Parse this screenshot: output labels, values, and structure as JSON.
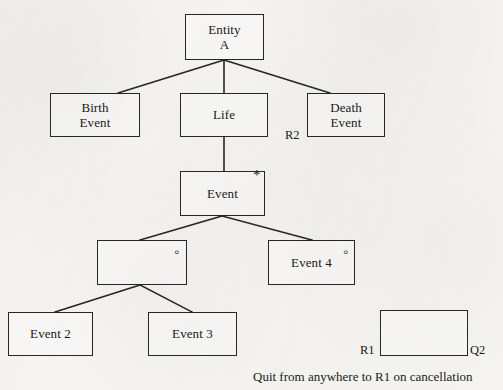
{
  "diagram": {
    "type": "statechart",
    "background_color": "#f6f5f2",
    "line_color": "#262626",
    "nodes": [
      {
        "id": "entity_a",
        "label": "Entity\nA",
        "x": 185,
        "y": 14,
        "w": 79,
        "h": 46,
        "marker": ""
      },
      {
        "id": "birth_event",
        "label": "Birth\nEvent",
        "x": 50,
        "y": 93,
        "w": 90,
        "h": 44,
        "marker": ""
      },
      {
        "id": "life",
        "label": "Life",
        "x": 180,
        "y": 93,
        "w": 88,
        "h": 44,
        "marker": ""
      },
      {
        "id": "death_event",
        "label": "Death\nEvent",
        "x": 307,
        "y": 93,
        "w": 78,
        "h": 44,
        "marker": ""
      },
      {
        "id": "event",
        "label": "Event",
        "x": 180,
        "y": 171,
        "w": 85,
        "h": 45,
        "marker": "asterisk"
      },
      {
        "id": "blank_left",
        "label": "",
        "x": 97,
        "y": 240,
        "w": 90,
        "h": 45,
        "marker": "circle"
      },
      {
        "id": "event4",
        "label": "Event 4",
        "x": 268,
        "y": 240,
        "w": 87,
        "h": 45,
        "marker": "circle"
      },
      {
        "id": "event2",
        "label": "Event 2",
        "x": 8,
        "y": 312,
        "w": 85,
        "h": 44,
        "marker": ""
      },
      {
        "id": "event3",
        "label": "Event 3",
        "x": 148,
        "y": 312,
        "w": 89,
        "h": 44,
        "marker": ""
      },
      {
        "id": "quit_state",
        "label": "",
        "x": 380,
        "y": 310,
        "w": 88,
        "h": 46,
        "marker": ""
      }
    ],
    "edge_labels": [
      {
        "id": "r2",
        "text": "R2",
        "x": 285,
        "y": 129
      },
      {
        "id": "r1",
        "text": "R1",
        "x": 360,
        "y": 344
      },
      {
        "id": "q2",
        "text": "Q2",
        "x": 470,
        "y": 344
      }
    ],
    "markers": {
      "asterisk": "*",
      "circle": "◦"
    },
    "caption": "Quit from anywhere to R1 on cancellation",
    "caption_x": 253,
    "caption_y": 370,
    "edges": [
      {
        "id": "entity-to-birth",
        "x1": 224,
        "y1": 60,
        "x2": 118,
        "y2": 93
      },
      {
        "id": "entity-to-life",
        "x1": 224,
        "y1": 60,
        "x2": 224,
        "y2": 93
      },
      {
        "id": "entity-to-death",
        "x1": 224,
        "y1": 60,
        "x2": 330,
        "y2": 93
      },
      {
        "id": "life-to-event",
        "x1": 224,
        "y1": 137,
        "x2": 224,
        "y2": 171
      },
      {
        "id": "event-to-blank",
        "x1": 222,
        "y1": 216,
        "x2": 140,
        "y2": 240
      },
      {
        "id": "event-to-event4",
        "x1": 222,
        "y1": 216,
        "x2": 312,
        "y2": 240
      },
      {
        "id": "blank-to-event2",
        "x1": 140,
        "y1": 285,
        "x2": 55,
        "y2": 312
      },
      {
        "id": "blank-to-event3",
        "x1": 140,
        "y1": 285,
        "x2": 192,
        "y2": 312
      }
    ]
  }
}
